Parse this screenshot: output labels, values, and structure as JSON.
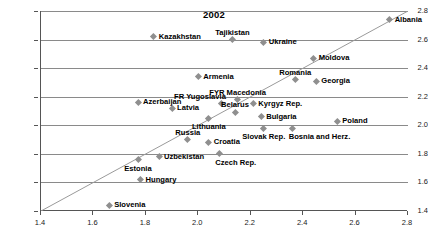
{
  "chart_data": {
    "type": "scatter",
    "title": "2002",
    "xlabel": "",
    "ylabel": "",
    "xlim": [
      1.4,
      2.8
    ],
    "ylim": [
      1.4,
      2.8
    ],
    "xticks": [
      "1.4",
      "1.6",
      "1.8",
      "2.0",
      "2.2",
      "2.4",
      "2.6",
      "2.8"
    ],
    "yticks": [
      "1.4",
      "1.6",
      "1.8",
      "2.0",
      "2.2",
      "2.4",
      "2.6",
      "2.8"
    ],
    "grid": "horizontal",
    "legend": "none",
    "reference_line": {
      "type": "45-degree identity line",
      "from": [
        1.4,
        1.4
      ],
      "to": [
        2.8,
        2.8
      ]
    },
    "marker_color": "#8f8f8f",
    "gridline_color": "#8a8a8a",
    "axis_color": "#555555",
    "points": [
      {
        "label": "Albania",
        "x": 2.73,
        "y": 2.74,
        "pos": "right"
      },
      {
        "label": "Kazakhstan",
        "x": 1.83,
        "y": 2.62,
        "pos": "right"
      },
      {
        "label": "Tajikistan",
        "x": 2.13,
        "y": 2.6,
        "pos": "above"
      },
      {
        "label": "Ukraine",
        "x": 2.25,
        "y": 2.58,
        "pos": "right"
      },
      {
        "label": "Moldova",
        "x": 2.44,
        "y": 2.47,
        "pos": "right"
      },
      {
        "label": "Armenia",
        "x": 2.0,
        "y": 2.34,
        "pos": "right"
      },
      {
        "label": "Romania",
        "x": 2.37,
        "y": 2.32,
        "pos": "above"
      },
      {
        "label": "Georgia",
        "x": 2.45,
        "y": 2.31,
        "pos": "right"
      },
      {
        "label": "FYR Macedonia",
        "x": 2.15,
        "y": 2.18,
        "pos": "above"
      },
      {
        "label": "Azerbaijan",
        "x": 1.77,
        "y": 2.16,
        "pos": "right"
      },
      {
        "label": "FR Yugoslavia",
        "x": 2.09,
        "y": 2.15,
        "pos": "above-left"
      },
      {
        "label": "Kyrgyz Rep.",
        "x": 2.21,
        "y": 2.15,
        "pos": "right"
      },
      {
        "label": "Latvia",
        "x": 1.9,
        "y": 2.12,
        "pos": "right"
      },
      {
        "label": "Belarus",
        "x": 2.14,
        "y": 2.09,
        "pos": "above"
      },
      {
        "label": "Bulgaria",
        "x": 2.24,
        "y": 2.06,
        "pos": "right"
      },
      {
        "label": "Lithuania",
        "x": 2.04,
        "y": 2.05,
        "pos": "below"
      },
      {
        "label": "Poland",
        "x": 2.53,
        "y": 2.03,
        "pos": "right"
      },
      {
        "label": "Slovak Rep.",
        "x": 2.25,
        "y": 1.98,
        "pos": "below"
      },
      {
        "label": "Bosnia and Herz.",
        "x": 2.36,
        "y": 1.98,
        "pos": "below-right"
      },
      {
        "label": "Russia",
        "x": 1.96,
        "y": 1.9,
        "pos": "above"
      },
      {
        "label": "Croatia",
        "x": 2.04,
        "y": 1.88,
        "pos": "right"
      },
      {
        "label": "Czech Rep.",
        "x": 2.08,
        "y": 1.8,
        "pos": "below-right"
      },
      {
        "label": "Uzbekistan",
        "x": 1.85,
        "y": 1.78,
        "pos": "right"
      },
      {
        "label": "Estonia",
        "x": 1.77,
        "y": 1.76,
        "pos": "below"
      },
      {
        "label": "Hungary",
        "x": 1.78,
        "y": 1.62,
        "pos": "right"
      },
      {
        "label": "Slovenia",
        "x": 1.66,
        "y": 1.44,
        "pos": "right"
      }
    ]
  }
}
